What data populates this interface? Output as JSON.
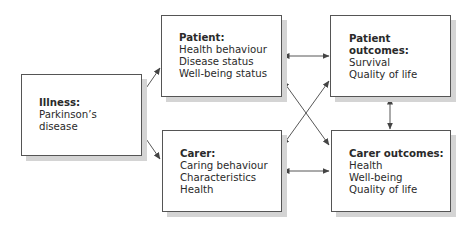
{
  "diagram": {
    "nodes": [
      {
        "id": "illness",
        "title": "Illness:",
        "lines": [
          "Parkinson’s",
          "disease"
        ]
      },
      {
        "id": "patient",
        "title": "Patient:",
        "lines": [
          "Health behaviour",
          "Disease status",
          "Well-being status"
        ]
      },
      {
        "id": "carer",
        "title": "Carer:",
        "lines": [
          "Caring behaviour",
          "Characteristics",
          "Health"
        ]
      },
      {
        "id": "patient_outcomes",
        "title": "Patient outcomes:",
        "lines": [
          "Survival",
          "Quality of life"
        ]
      },
      {
        "id": "carer_outcomes",
        "title": "Carer outcomes:",
        "lines": [
          "Health",
          "Well-being",
          "Quality of life"
        ]
      }
    ],
    "edges": [
      {
        "from": "illness",
        "to": "patient",
        "direction": "one-way"
      },
      {
        "from": "illness",
        "to": "carer",
        "direction": "one-way"
      },
      {
        "from": "patient",
        "to": "patient_outcomes",
        "direction": "two-way"
      },
      {
        "from": "patient",
        "to": "carer_outcomes",
        "direction": "two-way"
      },
      {
        "from": "carer",
        "to": "patient_outcomes",
        "direction": "two-way"
      },
      {
        "from": "carer",
        "to": "carer_outcomes",
        "direction": "two-way"
      },
      {
        "from": "patient_outcomes",
        "to": "carer_outcomes",
        "direction": "two-way"
      }
    ],
    "colors": {
      "border": "#555555",
      "shadow": "#d4d4d4",
      "arrow": "#444444",
      "text": "#2a2a2a"
    }
  }
}
